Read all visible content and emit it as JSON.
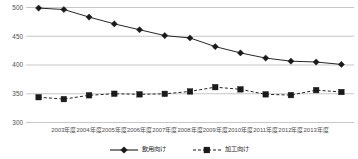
{
  "chart_data": {
    "type": "line",
    "title": "",
    "subtitle": "",
    "xlabel": "",
    "ylabel": "",
    "ylim": [
      300,
      500
    ],
    "yticks": [
      300,
      350,
      400,
      450,
      500
    ],
    "ytick_labels": [
      "300",
      "350",
      "400",
      "450",
      "500"
    ],
    "grid": true,
    "grid_axis": "y",
    "legend_position": "bottom-center",
    "categories": [
      "2003年度",
      "2004年度",
      "2005年度",
      "2006年度",
      "2007年度",
      "2008年度",
      "2009年度",
      "2010年度",
      "2011年度",
      "2012年度",
      "2013年度"
    ],
    "xtick_labels": [
      "2003年度",
      "2004年度",
      "2005年度",
      "2006年度",
      "2007年度",
      "2008年度",
      "2009年度",
      "2010年度",
      "2011年度",
      "2012年度",
      "2013年度"
    ],
    "n_points": 13,
    "series": [
      {
        "name": "飲用向け",
        "marker": "diamond",
        "line_style": "solid",
        "color": "#1a1a1a",
        "values": [
          499,
          496,
          477,
          466,
          452,
          447,
          429,
          417,
          407,
          406,
          401
        ]
      },
      {
        "name": "加工向け",
        "marker": "square",
        "line_style": "dashed",
        "color": "#1a1a1a",
        "values": [
          344,
          340,
          351,
          349,
          349,
          354,
          363,
          355,
          343,
          357,
          353
        ]
      }
    ]
  },
  "legend": {
    "entries": [
      {
        "label": "飲用向け",
        "marker": "diamond",
        "line_style": "solid"
      },
      {
        "label": "加工向け",
        "marker": "square",
        "line_style": "dashed"
      }
    ]
  },
  "colors": {
    "series": "#1a1a1a",
    "grid": "#b9b9b9",
    "axis_text": "#4d4d4d",
    "background": "#ffffff"
  }
}
